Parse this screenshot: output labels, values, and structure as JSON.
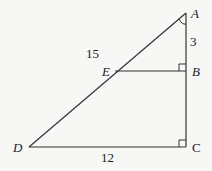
{
  "diagram": {
    "type": "geometry",
    "points": {
      "A": {
        "label": "A",
        "x": 186,
        "y": 13
      },
      "B": {
        "label": "B",
        "x": 186,
        "y": 71
      },
      "C": {
        "label": "C",
        "x": 186,
        "y": 147
      },
      "D": {
        "label": "D",
        "x": 29,
        "y": 147
      },
      "E": {
        "label": "E",
        "x": 115,
        "y": 71
      }
    },
    "segments": [
      {
        "from": "A",
        "to": "D"
      },
      {
        "from": "A",
        "to": "C"
      },
      {
        "from": "D",
        "to": "C"
      },
      {
        "from": "E",
        "to": "B"
      }
    ],
    "measurements": {
      "AB": "3",
      "AE": "15",
      "DC": "12"
    },
    "right_angles": [
      "B",
      "C"
    ],
    "angle_marks": [
      "A"
    ],
    "colors": {
      "stroke": "#333333",
      "background": "#f7f7f5"
    }
  }
}
